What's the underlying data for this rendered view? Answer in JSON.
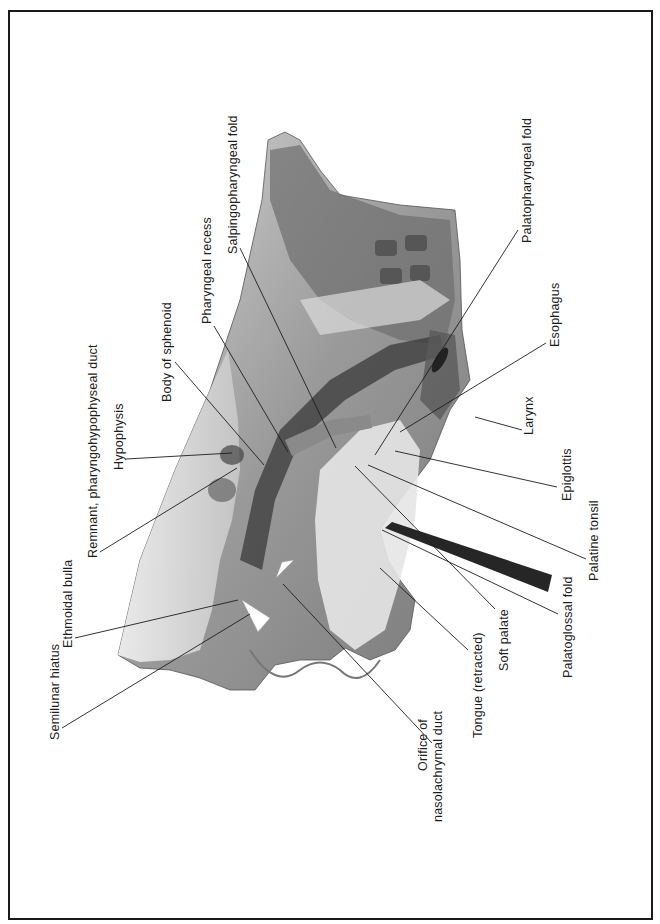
{
  "figure": {
    "colors": {
      "frame": "#1a1a1a",
      "leader": "#1d1d1d",
      "text": "#1d1d1d",
      "background": "#ffffff"
    }
  },
  "labels": [
    {
      "id": "semilunar-hiatus",
      "text": "Semilunar hiatus"
    },
    {
      "id": "ethmoidal-bulla",
      "text": "Ethmoidal bulla"
    },
    {
      "id": "remnant-duct",
      "text": "Remnant, pharyngohypophyseal duct"
    },
    {
      "id": "hypophysis",
      "text": "Hypophysis"
    },
    {
      "id": "body-of-sphenoid",
      "text": "Body of sphenoid"
    },
    {
      "id": "pharyngeal-recess",
      "text": "Pharyngeal recess"
    },
    {
      "id": "salpingopharyngeal-fold",
      "text": "Salpingopharyngeal fold"
    },
    {
      "id": "palatopharyngeal-fold",
      "text": "Palatopharyngeal fold"
    },
    {
      "id": "esophagus",
      "text": "Esophagus"
    },
    {
      "id": "larynx",
      "text": "Larynx"
    },
    {
      "id": "epiglottis",
      "text": "Epiglottis"
    },
    {
      "id": "palatine-tonsil",
      "text": "Palatine tonsil"
    },
    {
      "id": "palatoglossal-fold",
      "text": "Palatoglossal fold"
    },
    {
      "id": "soft-palate",
      "text": "Soft palate"
    },
    {
      "id": "tongue-retracted",
      "text": "Tongue (retracted)"
    },
    {
      "id": "orifice-nasolachrymal-duct",
      "line1": "Orifice of",
      "line2": "nasolachrymal duct"
    }
  ]
}
